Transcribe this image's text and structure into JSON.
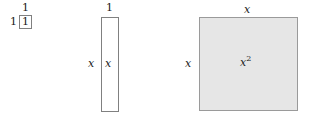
{
  "diagram": {
    "background_color": "#ffffff",
    "tiles": [
      {
        "name": "unit-tile",
        "area_label": "1",
        "top_label": "1",
        "left_label": "1",
        "fill_color": "#ffffff",
        "stroke_color": "#808080"
      },
      {
        "name": "linear-tile",
        "area_label": "x",
        "top_label": "1",
        "left_label": "x",
        "fill_color": "#ffffff",
        "stroke_color": "#808080"
      },
      {
        "name": "quadratic-tile",
        "area_label_base": "x",
        "area_label_exponent": "2",
        "top_label": "x",
        "left_label": "x",
        "fill_color": "#e6e6e6",
        "stroke_color": "#9a9a9a"
      }
    ]
  }
}
